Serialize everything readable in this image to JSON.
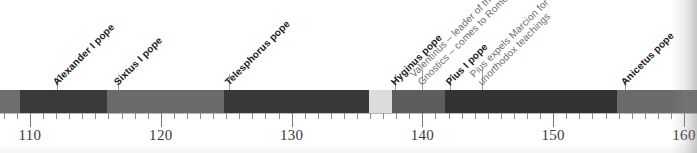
{
  "figure": {
    "axis": {
      "min": 107.7,
      "max": 161.0,
      "pixels_per_year": 13.08,
      "origin_px": 30,
      "origin_year": 110,
      "major_ticks": [
        {
          "year": 110,
          "label": "110"
        },
        {
          "year": 120,
          "label": "120"
        },
        {
          "year": 130,
          "label": "130"
        },
        {
          "year": 140,
          "label": "140"
        },
        {
          "year": 150,
          "label": "150"
        },
        {
          "year": 160,
          "label": "160"
        }
      ],
      "minor_tick_interval": 1
    },
    "colors": {
      "dark": "#3a3a3a",
      "medium": "#6b6b6b",
      "light": "#d4d4d4",
      "very_light": "#e2e2e2",
      "axis": "#8d8d8d",
      "label_bold": "#1c1c1c",
      "label_event": "#6d6d6d",
      "background": "#ffffff"
    },
    "segments": [
      {
        "name": "segment-pre-alexander",
        "start_px": 0,
        "end_px": 20,
        "color": "#6f6f6f"
      },
      {
        "name": "segment-alexander-i",
        "start_px": 20,
        "end_px": 107,
        "color": "#3a3a3a"
      },
      {
        "name": "segment-sixtus-i",
        "start_px": 107,
        "end_px": 224,
        "color": "#6b6b6b"
      },
      {
        "name": "segment-telesphorus",
        "start_px": 224,
        "end_px": 369,
        "color": "#393939"
      },
      {
        "name": "segment-gap-light",
        "start_px": 369,
        "end_px": 392,
        "color": "#dcdcdc"
      },
      {
        "name": "segment-hyginus",
        "start_px": 392,
        "end_px": 445,
        "color": "#5d5d5d"
      },
      {
        "name": "segment-pius-i",
        "start_px": 445,
        "end_px": 617,
        "color": "#333333"
      },
      {
        "name": "segment-anicetus",
        "start_px": 617,
        "end_px": 697,
        "color": "#6b6b6b"
      }
    ],
    "annotations": [
      {
        "name": "annotation-alexander-i-pope",
        "text": "Alexander I pope",
        "text2": "",
        "kind": "pope",
        "anchor_px": 57,
        "base_y": 88,
        "leader_top": 76,
        "leader_height": 14
      },
      {
        "name": "annotation-sixtus-i-pope",
        "text": "Sixtus I pope",
        "text2": "",
        "kind": "pope",
        "anchor_px": 118,
        "base_y": 88,
        "leader_top": 78,
        "leader_height": 12
      },
      {
        "name": "annotation-telesphorus-pope",
        "text": "Telesphorus pope",
        "text2": "",
        "kind": "pope",
        "anchor_px": 229,
        "base_y": 88,
        "leader_top": 74,
        "leader_height": 16
      },
      {
        "name": "annotation-hyginus-pope",
        "text": "Hyginus pope",
        "text2": "",
        "kind": "pope",
        "anchor_px": 395,
        "base_y": 88,
        "leader_top": 74,
        "leader_height": 16
      },
      {
        "name": "annotation-valentinus-gnostics",
        "text": "Valentinus – leader of the",
        "text2": "Gnostics – comes to Rome",
        "kind": "event",
        "anchor_px": 422,
        "base_y": 88,
        "leader_top": 70,
        "leader_height": 20
      },
      {
        "name": "annotation-pius-i-pope",
        "text": "Pius I pope",
        "text2": "",
        "kind": "pope",
        "anchor_px": 450,
        "base_y": 88,
        "leader_top": 74,
        "leader_height": 16
      },
      {
        "name": "annotation-pius-expels-marcion",
        "text": "Pius expels Marcion for",
        "text2": "unorthodox teachings",
        "kind": "event",
        "anchor_px": 482,
        "base_y": 88,
        "leader_top": 70,
        "leader_height": 20
      },
      {
        "name": "annotation-anicetus-pope",
        "text": "Anicetus pope",
        "text2": "",
        "kind": "pope",
        "anchor_px": 625,
        "base_y": 88,
        "leader_top": 78,
        "leader_height": 12
      }
    ]
  },
  "chart_data": {
    "type": "timeline",
    "xlabel": "",
    "ylabel": "",
    "xlim": [
      107.7,
      161.0
    ],
    "grid": false,
    "legend": "none",
    "tick_labels": [
      "110",
      "120",
      "130",
      "140",
      "150",
      "160"
    ],
    "tick_values": [
      110,
      120,
      130,
      140,
      150,
      160
    ],
    "minor_tick_interval": 1,
    "bands": [
      {
        "label": "",
        "start_year": 107.7,
        "end_year": 109.2,
        "shade": "medium"
      },
      {
        "label": "Alexander I pope",
        "start_year": 109.2,
        "end_year": 115.9,
        "shade": "dark"
      },
      {
        "label": "Sixtus I pope",
        "start_year": 115.9,
        "end_year": 124.8,
        "shade": "medium"
      },
      {
        "label": "Telesphorus pope",
        "start_year": 124.8,
        "end_year": 135.9,
        "shade": "dark"
      },
      {
        "label": "",
        "start_year": 135.9,
        "end_year": 137.7,
        "shade": "very-light"
      },
      {
        "label": "Hyginus pope",
        "start_year": 137.7,
        "end_year": 141.7,
        "shade": "medium"
      },
      {
        "label": "Pius I pope",
        "start_year": 141.7,
        "end_year": 154.9,
        "shade": "dark"
      },
      {
        "label": "Anicetus pope",
        "start_year": 154.9,
        "end_year": 161.0,
        "shade": "medium"
      }
    ],
    "events": [
      {
        "label": "Alexander I pope",
        "year": 112.1,
        "emphasis": "bold"
      },
      {
        "label": "Sixtus I pope",
        "year": 116.7,
        "emphasis": "bold"
      },
      {
        "label": "Telesphorus pope",
        "year": 125.2,
        "emphasis": "bold"
      },
      {
        "label": "Hyginus pope",
        "year": 137.9,
        "emphasis": "bold"
      },
      {
        "label": "Valentinus – leader of the Gnostics – comes to Rome",
        "year": 140.0,
        "emphasis": "regular"
      },
      {
        "label": "Pius I pope",
        "year": 142.1,
        "emphasis": "bold"
      },
      {
        "label": "Pius expels Marcion for unorthodox teachings",
        "year": 144.6,
        "emphasis": "regular"
      },
      {
        "label": "Anicetus pope",
        "year": 155.5,
        "emphasis": "bold"
      }
    ]
  }
}
